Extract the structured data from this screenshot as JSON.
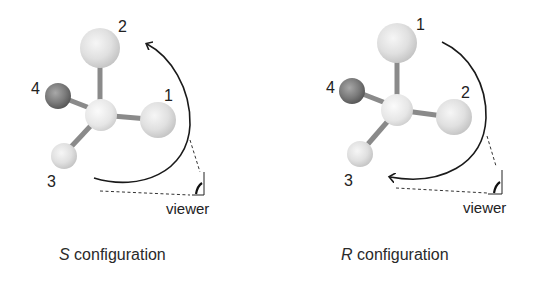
{
  "panels": [
    {
      "id": "s",
      "configuration_letter": "S",
      "caption_rest": " configuration",
      "labels": {
        "top": "2",
        "right": "1",
        "left": "4",
        "bottom": "3"
      },
      "arrow_direction": "counterclockwise",
      "viewer_label": "viewer"
    },
    {
      "id": "r",
      "configuration_letter": "R",
      "caption_rest": " configuration",
      "labels": {
        "top": "1",
        "right": "2",
        "left": "4",
        "bottom": "3"
      },
      "arrow_direction": "clockwise",
      "viewer_label": "viewer"
    }
  ],
  "colors": {
    "light_atom": "#e2e2e2",
    "dark_atom": "#777777",
    "bond": "#8a8a8a",
    "arrow": "#1a1a1a"
  }
}
